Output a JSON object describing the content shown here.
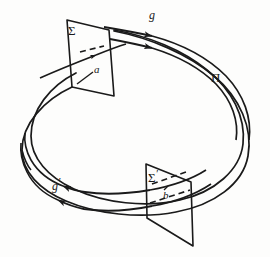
{
  "figure": {
    "background_color": "#fdfdfc",
    "ink_color": "#1a1a1a",
    "width": 270,
    "height": 257
  },
  "labels": {
    "sigma": "Σ",
    "sigma_prime_base": "Σ",
    "sigma_prime_mark": "′",
    "pi": "Π",
    "g": "g",
    "g_prime_base": "g",
    "g_prime_mark": "′",
    "a": "a",
    "b": "b"
  },
  "elements": {
    "band_outer_name": "band-outer-curve",
    "band_inner_name": "band-inner-curve",
    "cross_section_1": "Σ",
    "cross_section_2": "Σ′",
    "orbit_forward": "g",
    "orbit_backward": "g′",
    "point_a": "a",
    "point_b": "b",
    "surface": "Π"
  },
  "geometry": {
    "sigma_quad": [
      [
        67,
        20
      ],
      [
        109,
        30
      ],
      [
        114,
        96
      ],
      [
        72,
        87
      ]
    ],
    "sigma_prime_quad": [
      [
        146,
        164
      ],
      [
        191,
        182
      ],
      [
        193,
        246
      ],
      [
        147,
        218
      ]
    ],
    "arrow_count_top": 2,
    "arrow_count_bottom": 2,
    "dash_segments_sigma": 1,
    "dash_segments_sigma_prime": 2
  }
}
